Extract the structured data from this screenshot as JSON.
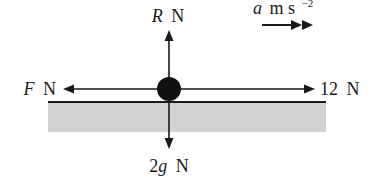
{
  "diagram": {
    "type": "force-diagram",
    "colors": {
      "ink": "#1a1a1a",
      "ground_fill": "#d2d2d2",
      "background": "#ffffff"
    },
    "acceleration": {
      "symbol": "a",
      "unit": "m s",
      "exponent": "−2",
      "icon": "double-arrow-right-icon"
    },
    "forces": {
      "up": {
        "symbol": "R",
        "unit": "N"
      },
      "left": {
        "symbol": "F",
        "unit": "N"
      },
      "right": {
        "value": "12",
        "unit": "N"
      },
      "down": {
        "coefficient": "2",
        "symbol": "g",
        "unit": "N"
      }
    },
    "particle": {
      "icon": "particle-icon"
    },
    "surface": {
      "icon": "ground-surface"
    }
  }
}
